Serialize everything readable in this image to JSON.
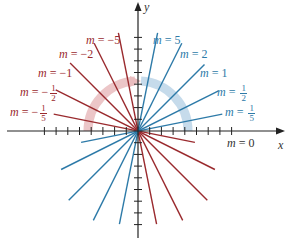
{
  "figure": {
    "caption_fragment": "Figure",
    "axes": {
      "x_label": "x",
      "y_label": "y"
    },
    "colors": {
      "negative": "#9a2a2e",
      "positive": "#2d7aa8",
      "axis": "#222222",
      "arc_negative": "#e8b9bb",
      "arc_positive": "#b9d3e6"
    },
    "labels": {
      "neg5": {
        "var": "m",
        "eq": "=",
        "sign": "−",
        "value": "5"
      },
      "neg2": {
        "var": "m",
        "eq": "=",
        "sign": "−",
        "value": "2"
      },
      "neg1": {
        "var": "m",
        "eq": "=",
        "sign": "−",
        "value": "1"
      },
      "neghalf": {
        "var": "m",
        "eq": "=",
        "sign": "−",
        "num": "1",
        "den": "2"
      },
      "negfifth": {
        "var": "m",
        "eq": "=",
        "sign": "−",
        "num": "1",
        "den": "5"
      },
      "pos5": {
        "var": "m",
        "eq": "=",
        "value": "5"
      },
      "pos2": {
        "var": "m",
        "eq": "=",
        "value": "2"
      },
      "pos1": {
        "var": "m",
        "eq": "=",
        "value": "1"
      },
      "poshalf": {
        "var": "m",
        "eq": "=",
        "num": "1",
        "den": "2"
      },
      "posfifth": {
        "var": "m",
        "eq": "=",
        "num": "1",
        "den": "5"
      },
      "zero": {
        "var": "m",
        "eq": "=",
        "value": "0"
      }
    }
  },
  "chart_data": {
    "type": "line",
    "xlabel": "x",
    "ylabel": "y",
    "grid": false,
    "series": [
      {
        "name": "m = -5",
        "slope": -5,
        "color": "#9a2a2e"
      },
      {
        "name": "m = -2",
        "slope": -2,
        "color": "#9a2a2e"
      },
      {
        "name": "m = -1",
        "slope": -1,
        "color": "#9a2a2e"
      },
      {
        "name": "m = -1/2",
        "slope": -0.5,
        "color": "#9a2a2e"
      },
      {
        "name": "m = -1/5",
        "slope": -0.2,
        "color": "#9a2a2e"
      },
      {
        "name": "m = 0",
        "slope": 0,
        "color": "#222222"
      },
      {
        "name": "m = 1/5",
        "slope": 0.2,
        "color": "#2d7aa8"
      },
      {
        "name": "m = 1/2",
        "slope": 0.5,
        "color": "#2d7aa8"
      },
      {
        "name": "m = 1",
        "slope": 1,
        "color": "#2d7aa8"
      },
      {
        "name": "m = 2",
        "slope": 2,
        "color": "#2d7aa8"
      },
      {
        "name": "m = 5",
        "slope": 5,
        "color": "#2d7aa8"
      }
    ],
    "annotations": [
      "Red arc: negative slopes",
      "Blue arc: positive slopes"
    ]
  }
}
